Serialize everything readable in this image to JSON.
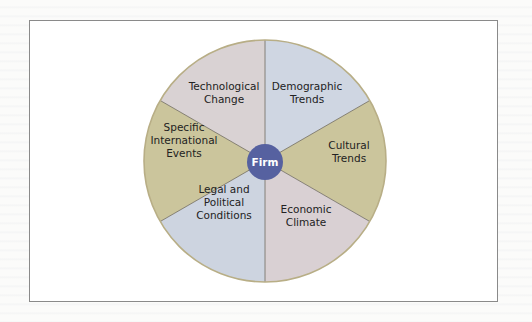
{
  "diagram": {
    "type": "segmented-wheel",
    "center": {
      "label": "Firm",
      "color": "#5661a0",
      "text_color": "#ffffff"
    },
    "outline_color": "#b8ae86",
    "divider_color": "#6e6a60",
    "segments": [
      {
        "id": "technological-change",
        "lines": [
          "Technological",
          "Change"
        ],
        "color": "#d9d2d3",
        "position": "top-left"
      },
      {
        "id": "demographic-trends",
        "lines": [
          "Demographic",
          "Trends"
        ],
        "color": "#cfd6e2",
        "position": "top-right"
      },
      {
        "id": "cultural-trends",
        "lines": [
          "Cultural",
          "Trends"
        ],
        "color": "#cbc59c",
        "position": "right"
      },
      {
        "id": "economic-climate",
        "lines": [
          "Economic",
          "Climate"
        ],
        "color": "#d9d0d3",
        "position": "bottom-right"
      },
      {
        "id": "legal-political-conditions",
        "lines": [
          "Legal and",
          "Political",
          "Conditions"
        ],
        "color": "#cdd4e0",
        "position": "bottom-left"
      },
      {
        "id": "specific-international-events",
        "lines": [
          "Specific",
          "International",
          "Events"
        ],
        "color": "#cbc59c",
        "position": "left"
      }
    ]
  }
}
